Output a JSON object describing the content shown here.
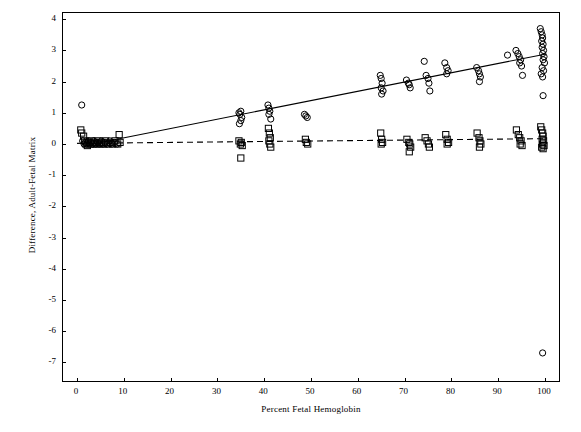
{
  "chart_data": {
    "type": "scatter",
    "title": "",
    "xlabel": "Percent Fetal Hemoglobin",
    "ylabel": "Difference, Adult-Fetal Matrix",
    "xlim": [
      -3,
      103
    ],
    "ylim": [
      -7.6,
      4.2
    ],
    "xticks": [
      0,
      10,
      20,
      30,
      40,
      50,
      60,
      70,
      80,
      90,
      100
    ],
    "ytick_labels": [
      "4",
      "3",
      "2",
      "1",
      "0",
      "-1",
      "-2",
      "-3",
      "-4",
      "-5",
      "-6",
      "-7"
    ],
    "yticks": [
      4,
      3,
      2,
      1,
      0,
      -1,
      -2,
      -3,
      -4,
      -5,
      -6,
      -7
    ],
    "grid": false,
    "legend": "none",
    "series": [
      {
        "name": "circle-series",
        "marker": "circle",
        "points": [
          [
            1.0,
            1.25
          ],
          [
            1.2,
            0.1
          ],
          [
            1.5,
            0.0
          ],
          [
            1.8,
            0.05
          ],
          [
            2.0,
            0.0
          ],
          [
            2.4,
            0.1
          ],
          [
            2.6,
            0.0
          ],
          [
            3.0,
            0.05
          ],
          [
            3.3,
            0.0
          ],
          [
            3.6,
            0.1
          ],
          [
            4.0,
            0.0
          ],
          [
            4.4,
            0.05
          ],
          [
            4.8,
            0.0
          ],
          [
            5.2,
            0.1
          ],
          [
            5.6,
            0.0
          ],
          [
            6.0,
            0.05
          ],
          [
            6.5,
            0.0
          ],
          [
            7.0,
            0.1
          ],
          [
            7.5,
            0.0
          ],
          [
            8.0,
            0.05
          ],
          [
            8.6,
            0.0
          ],
          [
            34.6,
            1.0
          ],
          [
            34.8,
            0.95
          ],
          [
            35.0,
            1.05
          ],
          [
            35.2,
            0.85
          ],
          [
            35.0,
            0.75
          ],
          [
            34.7,
            0.65
          ],
          [
            40.8,
            1.25
          ],
          [
            41.0,
            1.15
          ],
          [
            41.2,
            1.05
          ],
          [
            41.0,
            0.95
          ],
          [
            41.4,
            0.8
          ],
          [
            48.6,
            0.95
          ],
          [
            48.9,
            0.9
          ],
          [
            49.2,
            0.85
          ],
          [
            64.8,
            2.2
          ],
          [
            65.0,
            2.1
          ],
          [
            65.2,
            1.95
          ],
          [
            65.0,
            1.8
          ],
          [
            65.4,
            1.7
          ],
          [
            65.1,
            1.6
          ],
          [
            70.4,
            2.05
          ],
          [
            70.8,
            1.95
          ],
          [
            71.0,
            1.9
          ],
          [
            71.2,
            1.8
          ],
          [
            74.2,
            2.65
          ],
          [
            74.6,
            2.2
          ],
          [
            75.0,
            2.1
          ],
          [
            75.2,
            1.95
          ],
          [
            75.4,
            1.7
          ],
          [
            78.6,
            2.6
          ],
          [
            79.0,
            2.45
          ],
          [
            79.3,
            2.35
          ],
          [
            79.0,
            2.25
          ],
          [
            85.4,
            2.45
          ],
          [
            85.8,
            2.35
          ],
          [
            86.0,
            2.25
          ],
          [
            86.2,
            2.15
          ],
          [
            86.0,
            2.0
          ],
          [
            92.0,
            2.85
          ],
          [
            93.8,
            3.0
          ],
          [
            94.2,
            2.9
          ],
          [
            94.5,
            2.8
          ],
          [
            94.8,
            2.7
          ],
          [
            94.6,
            2.6
          ],
          [
            95.0,
            2.5
          ],
          [
            95.2,
            2.2
          ],
          [
            99.0,
            3.7
          ],
          [
            99.2,
            3.6
          ],
          [
            99.4,
            3.5
          ],
          [
            99.5,
            3.4
          ],
          [
            99.3,
            3.3
          ],
          [
            99.6,
            3.2
          ],
          [
            99.4,
            3.1
          ],
          [
            99.7,
            3.0
          ],
          [
            99.5,
            2.9
          ],
          [
            99.8,
            2.8
          ],
          [
            99.6,
            2.7
          ],
          [
            99.9,
            2.6
          ],
          [
            99.4,
            2.45
          ],
          [
            99.7,
            2.35
          ],
          [
            99.2,
            2.25
          ],
          [
            99.5,
            2.15
          ],
          [
            99.6,
            1.55
          ],
          [
            99.5,
            -6.7
          ]
        ]
      },
      {
        "name": "square-series",
        "marker": "square",
        "points": [
          [
            0.8,
            0.45
          ],
          [
            1.0,
            0.35
          ],
          [
            1.4,
            0.25
          ],
          [
            1.6,
            0.1
          ],
          [
            1.9,
            0.0
          ],
          [
            2.2,
            -0.05
          ],
          [
            2.5,
            0.05
          ],
          [
            2.8,
            0.0
          ],
          [
            3.1,
            0.1
          ],
          [
            3.4,
            0.0
          ],
          [
            3.7,
            0.05
          ],
          [
            4.1,
            0.0
          ],
          [
            4.5,
            0.1
          ],
          [
            4.9,
            0.0
          ],
          [
            5.3,
            0.05
          ],
          [
            5.7,
            0.0
          ],
          [
            6.1,
            0.1
          ],
          [
            6.6,
            0.0
          ],
          [
            7.1,
            0.05
          ],
          [
            7.6,
            0.0
          ],
          [
            8.1,
            0.1
          ],
          [
            8.7,
            0.0
          ],
          [
            9.0,
            0.3
          ],
          [
            9.2,
            0.05
          ],
          [
            34.6,
            0.1
          ],
          [
            34.9,
            0.0
          ],
          [
            35.1,
            0.05
          ],
          [
            35.3,
            -0.05
          ],
          [
            35.0,
            -0.45
          ],
          [
            40.9,
            0.5
          ],
          [
            41.1,
            0.35
          ],
          [
            41.3,
            0.2
          ],
          [
            41.0,
            0.1
          ],
          [
            41.2,
            0.0
          ],
          [
            41.4,
            -0.1
          ],
          [
            48.8,
            0.15
          ],
          [
            49.0,
            0.05
          ],
          [
            49.3,
            0.0
          ],
          [
            64.9,
            0.35
          ],
          [
            65.1,
            0.15
          ],
          [
            65.3,
            0.05
          ],
          [
            65.0,
            0.0
          ],
          [
            70.5,
            0.15
          ],
          [
            70.9,
            0.05
          ],
          [
            71.1,
            0.0
          ],
          [
            71.3,
            -0.1
          ],
          [
            71.0,
            -0.25
          ],
          [
            74.4,
            0.2
          ],
          [
            74.8,
            0.1
          ],
          [
            75.1,
            0.0
          ],
          [
            75.3,
            -0.1
          ],
          [
            78.8,
            0.3
          ],
          [
            79.1,
            0.15
          ],
          [
            79.4,
            0.05
          ],
          [
            79.1,
            0.0
          ],
          [
            85.5,
            0.35
          ],
          [
            85.9,
            0.2
          ],
          [
            86.1,
            0.1
          ],
          [
            86.3,
            0.0
          ],
          [
            86.0,
            -0.1
          ],
          [
            93.9,
            0.45
          ],
          [
            94.3,
            0.3
          ],
          [
            94.6,
            0.2
          ],
          [
            94.9,
            0.1
          ],
          [
            94.7,
            0.0
          ],
          [
            95.1,
            -0.05
          ],
          [
            99.1,
            0.55
          ],
          [
            99.3,
            0.45
          ],
          [
            99.5,
            0.35
          ],
          [
            99.6,
            0.25
          ],
          [
            99.4,
            0.15
          ],
          [
            99.7,
            0.1
          ],
          [
            99.5,
            0.0
          ],
          [
            99.8,
            -0.05
          ],
          [
            99.3,
            -0.1
          ],
          [
            99.6,
            -0.15
          ]
        ]
      }
    ],
    "fit_lines": [
      {
        "name": "solid-regression-line",
        "style": "solid",
        "x0": 5.0,
        "y0": 0.05,
        "x1": 100.0,
        "y1": 2.88
      },
      {
        "name": "dashed-regression-line",
        "style": "dashed",
        "x0": 0.0,
        "y0": 0.02,
        "x1": 100.0,
        "y1": 0.17
      }
    ]
  }
}
